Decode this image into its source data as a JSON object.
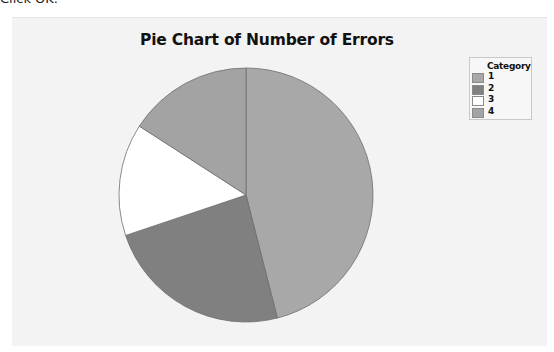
{
  "page": {
    "cut_off_text": "Click OK."
  },
  "chart_data": {
    "type": "pie",
    "title": "Pie Chart of Number of Errors",
    "categories": [
      "1",
      "2",
      "3",
      "4"
    ],
    "values": [
      29,
      15,
      9,
      10
    ],
    "percentages": [
      46.0,
      23.8,
      14.3,
      15.9
    ],
    "start_angle_deg": 0,
    "direction": "clockwise",
    "colors": [
      "#a8a8a8",
      "#808080",
      "#ffffff",
      "#a3a3a3"
    ],
    "slice_edge_color": "#6e6e6e",
    "legend": {
      "title": "Category",
      "position": "top-right",
      "entries": [
        "1",
        "2",
        "3",
        "4"
      ]
    },
    "background_color": "#f3f3f3"
  }
}
